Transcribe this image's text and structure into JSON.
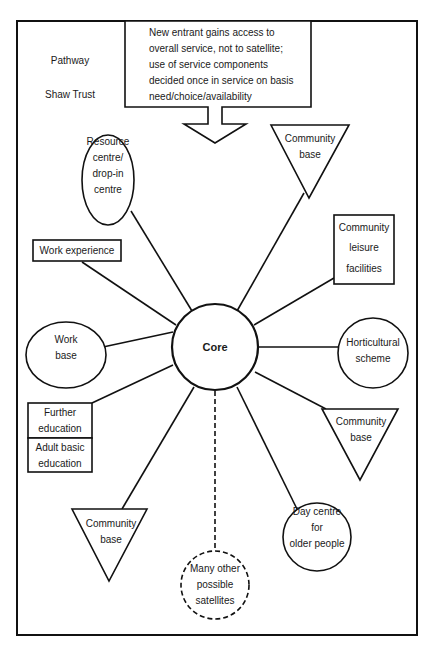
{
  "diagram": {
    "type": "hub-and-spoke service model",
    "side_labels": [
      "Pathway",
      "Shaw Trust"
    ],
    "note": {
      "lines": [
        "New entrant gains access to",
        "overall service, not to satellite;",
        "use of service components",
        "decided once in service on basis",
        "need/choice/availability"
      ]
    },
    "core": {
      "label": "Core"
    },
    "satellites": [
      {
        "id": "resource-centre",
        "shape": "ellipse",
        "lines": [
          "Resource",
          "centre/",
          "drop-in",
          "centre"
        ]
      },
      {
        "id": "community-base-top",
        "shape": "triangle",
        "lines": [
          "Community",
          "base"
        ]
      },
      {
        "id": "community-leisure",
        "shape": "rectangle",
        "lines": [
          "Community",
          "leisure",
          "facilities"
        ]
      },
      {
        "id": "work-experience",
        "shape": "rectangle",
        "lines": [
          "Work experience"
        ]
      },
      {
        "id": "work-base",
        "shape": "ellipse",
        "lines": [
          "Work",
          "base"
        ]
      },
      {
        "id": "horticultural",
        "shape": "circle",
        "lines": [
          "Horticultural",
          "scheme"
        ]
      },
      {
        "id": "further-education",
        "shape": "rectangle",
        "lines": [
          "Further",
          "education"
        ]
      },
      {
        "id": "adult-basic-education",
        "shape": "rectangle",
        "lines": [
          "Adult basic",
          "education"
        ]
      },
      {
        "id": "community-base-right",
        "shape": "triangle",
        "lines": [
          "Community",
          "base"
        ]
      },
      {
        "id": "community-base-bottom",
        "shape": "triangle",
        "lines": [
          "Community",
          "base"
        ]
      },
      {
        "id": "day-centre",
        "shape": "circle",
        "lines": [
          "Day centre",
          "for",
          "older people"
        ]
      },
      {
        "id": "other-satellites",
        "shape": "dashed-circle",
        "lines": [
          "Many other",
          "possible",
          "satellites"
        ]
      }
    ]
  }
}
